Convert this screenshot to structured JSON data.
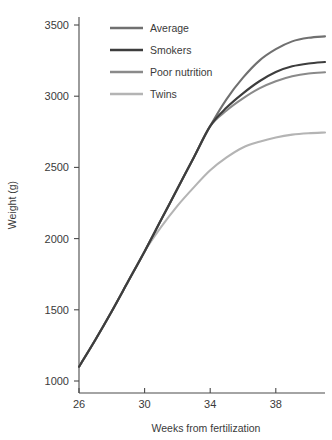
{
  "chart_data": {
    "type": "line",
    "title": "",
    "xlabel": "Weeks from fertilization",
    "ylabel": "Weight (g)",
    "xlim": [
      26,
      41
    ],
    "ylim": [
      1000,
      3600
    ],
    "xticks": [
      26,
      30,
      34,
      38
    ],
    "yticks": [
      1000,
      1500,
      2000,
      2500,
      3000,
      3500
    ],
    "grid": false,
    "legend_position": "top-left",
    "series": [
      {
        "name": "Average",
        "color": "#707070",
        "x": [
          26,
          27,
          28,
          29,
          30,
          31,
          32,
          33,
          34,
          35,
          36,
          37,
          38,
          39,
          40,
          41
        ],
        "values": [
          1100,
          1290,
          1490,
          1700,
          1910,
          2130,
          2350,
          2570,
          2790,
          2980,
          3130,
          3250,
          3330,
          3385,
          3410,
          3420
        ]
      },
      {
        "name": "Smokers",
        "color": "#3d3d3d",
        "x": [
          26,
          27,
          28,
          29,
          30,
          31,
          32,
          33,
          34,
          35,
          36,
          37,
          38,
          39,
          40,
          41
        ],
        "values": [
          1100,
          1290,
          1490,
          1700,
          1910,
          2130,
          2350,
          2570,
          2790,
          2920,
          3020,
          3105,
          3170,
          3210,
          3230,
          3240
        ]
      },
      {
        "name": "Poor nutrition",
        "color": "#8a8a8a",
        "x": [
          26,
          27,
          28,
          29,
          30,
          31,
          32,
          33,
          34,
          35,
          36,
          37,
          38,
          39,
          40,
          41
        ],
        "values": [
          1100,
          1290,
          1490,
          1700,
          1910,
          2130,
          2350,
          2570,
          2790,
          2900,
          2985,
          3055,
          3105,
          3140,
          3160,
          3168
        ]
      },
      {
        "name": "Twins",
        "color": "#b4b4b4",
        "x": [
          26,
          27,
          28,
          29,
          30,
          31,
          32,
          33,
          34,
          35,
          36,
          37,
          38,
          39,
          40,
          41
        ],
        "values": [
          1100,
          1290,
          1490,
          1700,
          1910,
          2080,
          2230,
          2360,
          2480,
          2570,
          2640,
          2680,
          2710,
          2730,
          2740,
          2745
        ]
      }
    ]
  },
  "legend": {
    "items": [
      {
        "label": "Average"
      },
      {
        "label": "Smokers"
      },
      {
        "label": "Poor nutrition"
      },
      {
        "label": "Twins"
      }
    ]
  },
  "axes": {
    "x_title": "Weeks from fertilization",
    "y_title": "Weight (g)",
    "x_tick_labels": [
      "26",
      "30",
      "34",
      "38"
    ],
    "y_tick_labels": [
      "1000",
      "1500",
      "2000",
      "2500",
      "3000",
      "3500"
    ]
  }
}
